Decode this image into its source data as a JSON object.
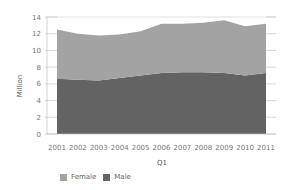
{
  "chart_data": {
    "type": "area",
    "stacked": true,
    "title": "",
    "xlabel": "Q1",
    "ylabel": "Million",
    "ylim": [
      0,
      14
    ],
    "yticks": [
      0,
      2,
      4,
      6,
      8,
      10,
      12,
      14
    ],
    "grid": false,
    "legend_position": "bottom-left",
    "categories": [
      "2001",
      "2002",
      "2003",
      "2004",
      "2005",
      "2006",
      "2007",
      "2008",
      "2009",
      "2010",
      "2011"
    ],
    "series": [
      {
        "name": "Male",
        "color": "#636363",
        "values": [
          6.6,
          6.5,
          6.4,
          6.7,
          7.0,
          7.3,
          7.4,
          7.4,
          7.3,
          7.0,
          7.3
        ]
      },
      {
        "name": "Female",
        "color": "#a3a3a3",
        "values": [
          5.9,
          5.5,
          5.4,
          5.2,
          5.3,
          5.9,
          5.8,
          5.9,
          6.3,
          5.9,
          5.9
        ]
      }
    ],
    "legend": [
      "Female",
      "Male"
    ]
  },
  "axis": {
    "y_title": "Million",
    "x_title": "Q1"
  },
  "legend": {
    "items": [
      {
        "label": "Female",
        "color": "#a3a3a3"
      },
      {
        "label": "Male",
        "color": "#636363"
      }
    ]
  }
}
